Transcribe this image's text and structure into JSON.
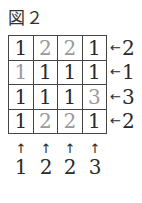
{
  "title": "図２",
  "grid": [
    [
      {
        "v": "1",
        "gray": false
      },
      {
        "v": "2",
        "gray": true
      },
      {
        "v": "2",
        "gray": true
      },
      {
        "v": "1",
        "gray": false
      }
    ],
    [
      {
        "v": "1",
        "gray": true
      },
      {
        "v": "1",
        "gray": false
      },
      {
        "v": "1",
        "gray": false
      },
      {
        "v": "1",
        "gray": false
      }
    ],
    [
      {
        "v": "1",
        "gray": false
      },
      {
        "v": "1",
        "gray": false
      },
      {
        "v": "1",
        "gray": false
      },
      {
        "v": "3",
        "gray": true
      }
    ],
    [
      {
        "v": "1",
        "gray": false
      },
      {
        "v": "2",
        "gray": true
      },
      {
        "v": "2",
        "gray": true
      },
      {
        "v": "1",
        "gray": false
      }
    ]
  ],
  "right_hints": [
    "2",
    "1",
    "3",
    "2"
  ],
  "bottom_hints": [
    "1",
    "2",
    "2",
    "3"
  ],
  "arrow_left": "←",
  "arrow_up": "↑",
  "colors": {
    "ink": "#2a2a2a",
    "gray_digit": "#9a9a9a",
    "border": "#444444"
  }
}
